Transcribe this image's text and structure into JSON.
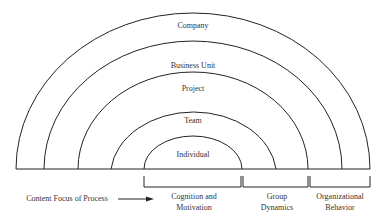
{
  "diagram": {
    "type": "concentric-semicircles",
    "levels": [
      {
        "label": "Company"
      },
      {
        "label": "Business Unit"
      },
      {
        "label": "Project"
      },
      {
        "label": "Team"
      },
      {
        "label": "Individual"
      }
    ],
    "axis_label": "Content Focus of Process",
    "brackets": [
      {
        "line1": "Cognition and",
        "line2": "Motivation"
      },
      {
        "line1": "Group",
        "line2": "Dynamics"
      },
      {
        "line1": "Organizational",
        "line2": "Behavior"
      }
    ],
    "colors": {
      "line": "#222222",
      "text": "#333333",
      "background": "#ffffff"
    }
  }
}
